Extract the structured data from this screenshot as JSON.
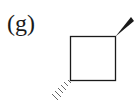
{
  "figure": {
    "label": "(g)",
    "molecule": "cyclobutane with wedge and hashed substituents",
    "bonds": {
      "wedge": "top-right",
      "hashed": "bottom-left"
    },
    "colors": {
      "stroke": "#1a1a1a",
      "background": "#ffffff"
    }
  }
}
